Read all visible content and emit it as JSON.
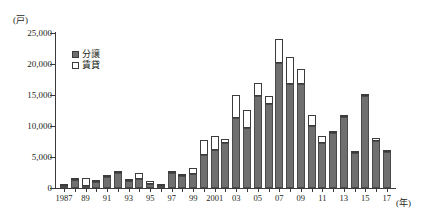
{
  "chart_data": {
    "type": "bar",
    "stacked": true,
    "title": "",
    "xlabel": "年",
    "ylabel": "戸",
    "y_unit_label": "(戸)",
    "x_unit_label": "(年)",
    "ylim": [
      0,
      25000
    ],
    "ytick_values": [
      0,
      5000,
      10000,
      15000,
      20000,
      25000
    ],
    "ytick_labels": [
      "0",
      "5,000",
      "10,000",
      "15,000",
      "20,000",
      "25,000"
    ],
    "grid": false,
    "legend_position": "upper-left-inside",
    "categories": [
      "1987",
      "1988",
      "1989",
      "1990",
      "1991",
      "1992",
      "1993",
      "1994",
      "1995",
      "1996",
      "1997",
      "1998",
      "1999",
      "2000",
      "2001",
      "2002",
      "2003",
      "2004",
      "2005",
      "2006",
      "2007",
      "2008",
      "2009",
      "2010",
      "2011",
      "2012",
      "2013",
      "2014",
      "2015",
      "2016",
      "2017"
    ],
    "xtick_labels": [
      "1987",
      "",
      "89",
      "",
      "91",
      "",
      "93",
      "",
      "95",
      "",
      "97",
      "",
      "99",
      "",
      "2001",
      "",
      "03",
      "",
      "05",
      "",
      "07",
      "",
      "09",
      "",
      "11",
      "",
      "13",
      "",
      "15",
      "",
      "17"
    ],
    "series": [
      {
        "name": "分譲",
        "color": "#6f6f6f",
        "values": [
          400,
          1300,
          300,
          900,
          1700,
          2400,
          1200,
          1400,
          600,
          300,
          2350,
          2000,
          2200,
          5400,
          6100,
          7250,
          11300,
          9700,
          14900,
          13500,
          20200,
          16800,
          16700,
          10000,
          7300,
          8900,
          11400,
          5700,
          14900,
          7600,
          5800
        ]
      },
      {
        "name": "賃貸",
        "color": "#ffffff",
        "values": [
          100,
          200,
          1250,
          350,
          400,
          300,
          250,
          1000,
          550,
          400,
          150,
          150,
          1000,
          2400,
          2300,
          600,
          3700,
          2900,
          2000,
          1400,
          3800,
          4400,
          2500,
          1800,
          1100,
          100,
          100,
          100,
          100,
          400,
          250
        ]
      }
    ],
    "totals": [
      500,
      1500,
      1550,
      1250,
      2100,
      2700,
      1450,
      2400,
      1150,
      700,
      2500,
      2150,
      3200,
      7800,
      8400,
      7850,
      15000,
      12600,
      16900,
      14900,
      24000,
      21200,
      19200,
      11800,
      8400,
      9000,
      11500,
      5800,
      15000,
      8000,
      6050
    ]
  },
  "legend": {
    "items": [
      {
        "label": "分譲"
      },
      {
        "label": "賃貸"
      }
    ]
  }
}
